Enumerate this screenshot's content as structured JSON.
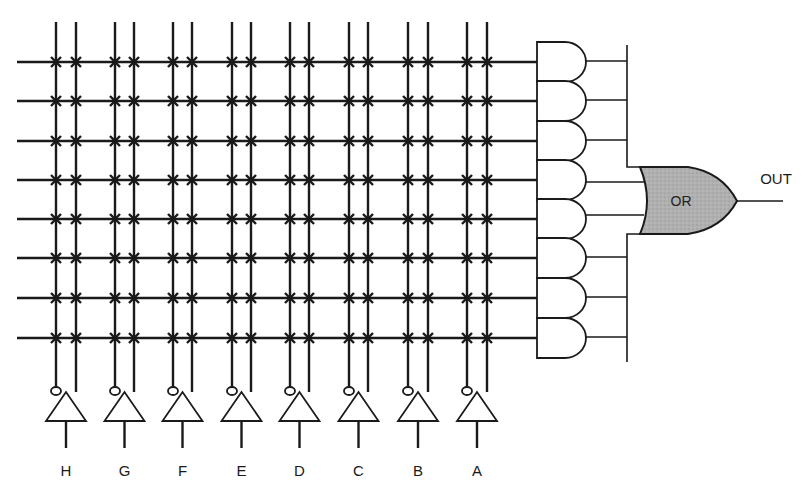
{
  "diagram": {
    "type": "PLA / AND-OR logic array",
    "inputs": [
      "H",
      "G",
      "F",
      "E",
      "D",
      "C",
      "B",
      "A"
    ],
    "product_terms": 8,
    "and_gate_count": 8,
    "or_gate": {
      "label": "OR"
    },
    "output": {
      "label": "OUT"
    },
    "colors": {
      "line": "#1a1a1a",
      "or_fill": "#a9a9a9",
      "background": "#ffffff"
    }
  },
  "labels": {
    "inputs": [
      "H",
      "G",
      "F",
      "E",
      "D",
      "C",
      "B",
      "A"
    ],
    "or_gate": "OR",
    "output": "OUT"
  }
}
